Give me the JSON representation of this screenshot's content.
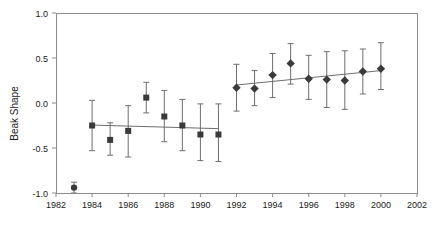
{
  "chart_data": {
    "type": "scatter",
    "title": "",
    "xlabel": "",
    "ylabel": "Beak Shape",
    "xlim": [
      1982,
      2002
    ],
    "ylim": [
      -1.0,
      1.0
    ],
    "xticks": [
      1982,
      1984,
      1986,
      1988,
      1990,
      1992,
      1994,
      1996,
      1998,
      2000,
      2002
    ],
    "xtick_labels": [
      "1982",
      "1984",
      "1986",
      "1988",
      "1990",
      "1992",
      "1994",
      "1996",
      "1998",
      "2000",
      "2002"
    ],
    "yticks": [
      -1.0,
      -0.5,
      0.0,
      0.5,
      1.0
    ],
    "ytick_labels": [
      "-1.0",
      "-0.5",
      "0.0",
      "0.5",
      "1.0"
    ],
    "grid": false,
    "legend": false,
    "marker_color": "#3a3a3a",
    "errorbar_color": "#6e6e6e",
    "trendline_color": "#6e6e6e",
    "axis_color": "#8c8c8c",
    "series": [
      {
        "name": "early-circle",
        "marker": "circle",
        "points": [
          {
            "x": 1983,
            "y": -0.94,
            "lo": -1.0,
            "hi": -0.88
          }
        ]
      },
      {
        "name": "squares",
        "marker": "square",
        "points": [
          {
            "x": 1984,
            "y": -0.25,
            "lo": -0.53,
            "hi": 0.03
          },
          {
            "x": 1985,
            "y": -0.41,
            "lo": -0.58,
            "hi": -0.22
          },
          {
            "x": 1986,
            "y": -0.31,
            "lo": -0.6,
            "hi": -0.03
          },
          {
            "x": 1987,
            "y": 0.06,
            "lo": -0.11,
            "hi": 0.23
          },
          {
            "x": 1988,
            "y": -0.15,
            "lo": -0.43,
            "hi": 0.14
          },
          {
            "x": 1989,
            "y": -0.25,
            "lo": -0.53,
            "hi": 0.04
          },
          {
            "x": 1990,
            "y": -0.35,
            "lo": -0.64,
            "hi": -0.01
          },
          {
            "x": 1991,
            "y": -0.35,
            "lo": -0.65,
            "hi": -0.01
          }
        ],
        "trend": {
          "x0": 1984,
          "y0": -0.245,
          "x1": 1991,
          "y1": -0.285
        }
      },
      {
        "name": "diamonds",
        "marker": "diamond",
        "points": [
          {
            "x": 1992,
            "y": 0.17,
            "lo": -0.09,
            "hi": 0.43
          },
          {
            "x": 1993,
            "y": 0.16,
            "lo": -0.03,
            "hi": 0.36
          },
          {
            "x": 1994,
            "y": 0.31,
            "lo": 0.06,
            "hi": 0.55
          },
          {
            "x": 1995,
            "y": 0.44,
            "lo": 0.21,
            "hi": 0.66
          },
          {
            "x": 1996,
            "y": 0.27,
            "lo": 0.04,
            "hi": 0.53
          },
          {
            "x": 1997,
            "y": 0.26,
            "lo": -0.05,
            "hi": 0.57
          },
          {
            "x": 1998,
            "y": 0.25,
            "lo": -0.07,
            "hi": 0.58
          },
          {
            "x": 1999,
            "y": 0.35,
            "lo": 0.1,
            "hi": 0.6
          },
          {
            "x": 2000,
            "y": 0.38,
            "lo": 0.15,
            "hi": 0.67
          }
        ],
        "trend": {
          "x0": 1992,
          "y0": 0.2,
          "x1": 2000,
          "y1": 0.36
        }
      }
    ]
  }
}
